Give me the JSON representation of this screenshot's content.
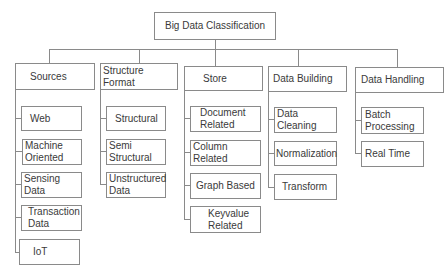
{
  "root": {
    "label": "Big Data Classification"
  },
  "categories": [
    {
      "label": "Sources",
      "children": [
        "Web",
        "Machine Oriented",
        "Sensing Data",
        "Transaction Data",
        "IoT"
      ]
    },
    {
      "label": "Structure Format",
      "children": [
        "Structural",
        "Semi Structural",
        "Unstructured Data"
      ]
    },
    {
      "label": "Store",
      "children": [
        "Document Related",
        "Column Related",
        "Graph Based",
        "Keyvalue Related"
      ]
    },
    {
      "label": "Data Building",
      "children": [
        "Data Cleaning",
        "Normalization",
        "Transform"
      ]
    },
    {
      "label": "Data Handling",
      "children": [
        "Batch Processing",
        "Real Time"
      ]
    }
  ]
}
